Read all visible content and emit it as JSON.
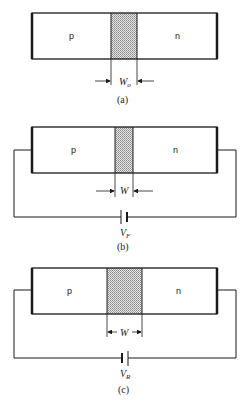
{
  "figures": [
    {
      "id": "a",
      "caption": "(a)",
      "region_left": "p",
      "region_right": "n",
      "width_label": "W",
      "width_sub": "o",
      "bias": "none"
    },
    {
      "id": "b",
      "caption": "(b)",
      "region_left": "p",
      "region_right": "n",
      "width_label": "W",
      "voltage_label": "V",
      "voltage_sub": "F",
      "bias": "forward"
    },
    {
      "id": "c",
      "caption": "(c)",
      "region_left": "p",
      "region_right": "n",
      "width_label": "W",
      "voltage_label": "V",
      "voltage_sub": "R",
      "bias": "reverse"
    }
  ],
  "colors": {
    "line": "#1a1a1a",
    "depletion_fill": "#bdbdbd"
  }
}
